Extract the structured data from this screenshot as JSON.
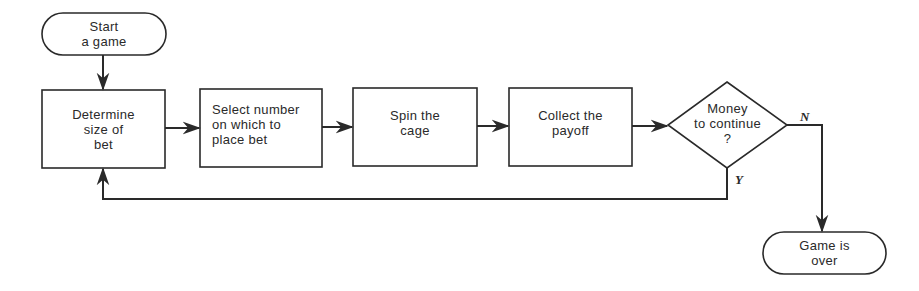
{
  "diagram": {
    "type": "flowchart",
    "nodes": {
      "start": {
        "shape": "terminator",
        "label": "Start\na game"
      },
      "determine_bet": {
        "shape": "process",
        "label": "Determine\nsize of\nbet"
      },
      "select_number": {
        "shape": "process",
        "label": "Select number\non which to\nplace bet"
      },
      "spin_cage": {
        "shape": "process",
        "label": "Spin the\ncage"
      },
      "collect_payoff": {
        "shape": "process",
        "label": "Collect the\npayoff"
      },
      "money_decision": {
        "shape": "decision",
        "label": "Money\nto continue\n?"
      },
      "game_over": {
        "shape": "terminator",
        "label": "Game is\nover"
      }
    },
    "edges": [
      {
        "from": "start",
        "to": "determine_bet",
        "label": ""
      },
      {
        "from": "determine_bet",
        "to": "select_number",
        "label": ""
      },
      {
        "from": "select_number",
        "to": "spin_cage",
        "label": ""
      },
      {
        "from": "spin_cage",
        "to": "collect_payoff",
        "label": ""
      },
      {
        "from": "collect_payoff",
        "to": "money_decision",
        "label": ""
      },
      {
        "from": "money_decision",
        "to": "game_over",
        "label": "N"
      },
      {
        "from": "money_decision",
        "to": "determine_bet",
        "label": "Y"
      }
    ],
    "branch_labels": {
      "no": "N",
      "yes": "Y"
    },
    "colors": {
      "stroke": "#2a2a2a",
      "background": "#ffffff"
    }
  }
}
